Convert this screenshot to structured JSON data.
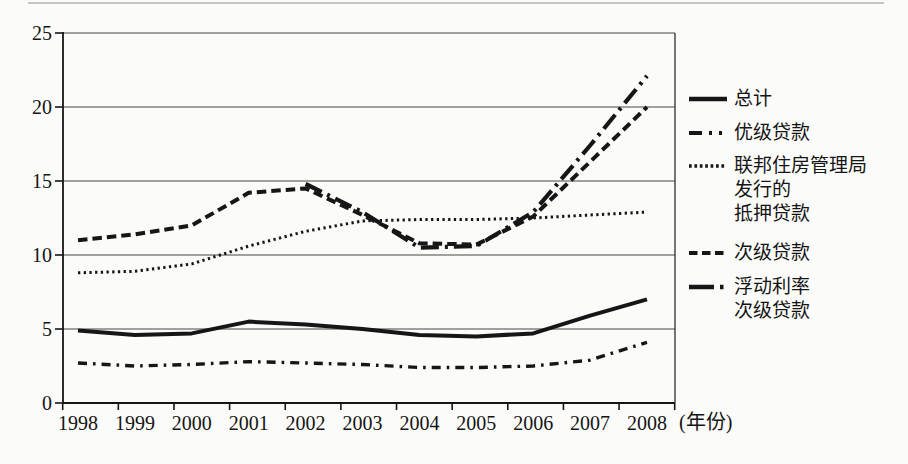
{
  "chart_data": {
    "type": "line",
    "title": "",
    "x_unit_label": "(年份)",
    "categories": [
      "1998",
      "1999",
      "2000",
      "2001",
      "2002",
      "2003",
      "2004",
      "2005",
      "2006",
      "2007",
      "2008"
    ],
    "ylim": [
      0,
      25
    ],
    "ytick_step": 5,
    "yticks": [
      0,
      5,
      10,
      15,
      20,
      25
    ],
    "grid": "horizontal",
    "legend_position": "right",
    "line_color": "#161616",
    "series": [
      {
        "name": "总计",
        "style": "solid",
        "values": [
          4.9,
          4.6,
          4.7,
          5.5,
          5.3,
          5.0,
          4.6,
          4.5,
          4.7,
          5.9,
          7.0
        ]
      },
      {
        "name": "优级贷款",
        "style": "dash-dot",
        "values": [
          2.7,
          2.5,
          2.6,
          2.8,
          2.7,
          2.6,
          2.4,
          2.4,
          2.5,
          2.9,
          4.1
        ]
      },
      {
        "name": "联邦住房管理局发行的抵押贷款",
        "style": "dotted",
        "values": [
          8.8,
          8.9,
          9.4,
          10.6,
          11.6,
          12.3,
          12.4,
          12.4,
          12.5,
          12.7,
          12.9
        ]
      },
      {
        "name": "次级贷款",
        "style": "dashed",
        "values": [
          11.0,
          11.4,
          12.0,
          14.2,
          14.5,
          12.7,
          10.8,
          10.7,
          12.6,
          16.3,
          20.0
        ]
      },
      {
        "name": "浮动利率次级贷款",
        "style": "long-dash-dot",
        "values": [
          null,
          null,
          null,
          null,
          14.8,
          12.9,
          10.5,
          10.6,
          12.9,
          17.4,
          22.1
        ]
      }
    ]
  },
  "legend": {
    "items": [
      {
        "name": "总计",
        "lines": [
          "总计"
        ]
      },
      {
        "name": "优级贷款",
        "lines": [
          "优级贷款"
        ]
      },
      {
        "name": "联邦住房管理局发行的抵押贷款",
        "lines": [
          "联邦住房管理局",
          "发行的",
          "抵押贷款"
        ]
      },
      {
        "name": "次级贷款",
        "lines": [
          "次级贷款"
        ]
      },
      {
        "name": "浮动利率次级贷款",
        "lines": [
          "浮动利率",
          "次级贷款"
        ]
      }
    ]
  }
}
